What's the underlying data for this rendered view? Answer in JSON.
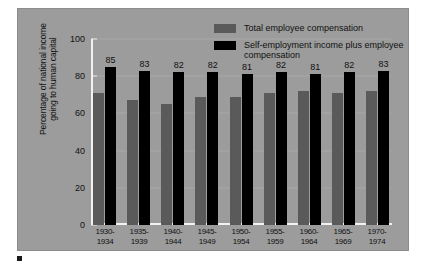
{
  "chart_data": {
    "type": "bar",
    "title": "",
    "xlabel": "",
    "ylabel": "Percentage of national income going to human capital",
    "ylim": [
      0,
      100
    ],
    "yticks": [
      100,
      80,
      60,
      40,
      20,
      0
    ],
    "grid": false,
    "legend_position": "top-right",
    "categories": [
      "1930-\n1934",
      "1935-\n1939",
      "1940-\n1944",
      "1945-\n1949",
      "1950-\n1954",
      "1955-\n1959",
      "1960-\n1964",
      "1965-\n1969",
      "1970-\n1974"
    ],
    "series": [
      {
        "name": "Total employee compensation",
        "color": "#5a5a5a",
        "labeled": false,
        "values": [
          71,
          67,
          65,
          69,
          69,
          71,
          72,
          71,
          72
        ]
      },
      {
        "name": "Self-employment income plus employee compensation",
        "color": "#000000",
        "labeled": true,
        "values": [
          85,
          83,
          82,
          82,
          81,
          82,
          81,
          82,
          83
        ]
      }
    ]
  },
  "ylabel_lines": [
    "Percentage of national income",
    "going to human capital"
  ],
  "xtick_labels": [
    {
      "top": "1930-",
      "bottom": "1934"
    },
    {
      "top": "1935-",
      "bottom": "1939"
    },
    {
      "top": "1940-",
      "bottom": "1944"
    },
    {
      "top": "1945-",
      "bottom": "1949"
    },
    {
      "top": "1950-",
      "bottom": "1954"
    },
    {
      "top": "1955-",
      "bottom": "1959"
    },
    {
      "top": "1960-",
      "bottom": "1964"
    },
    {
      "top": "1965-",
      "bottom": "1969"
    },
    {
      "top": "1970-",
      "bottom": "1974"
    }
  ],
  "legend": [
    {
      "label": "Total employee compensation",
      "color": "#5a5a5a"
    },
    {
      "label": "Self-employment income plus employee compensation",
      "color": "#000000"
    }
  ],
  "colors": {
    "panel_background": "#9c9c9c",
    "axis": "#f2f2f2",
    "gray_series": "#5a5a5a",
    "black_series": "#000000",
    "text": "#111111"
  },
  "caption": ""
}
